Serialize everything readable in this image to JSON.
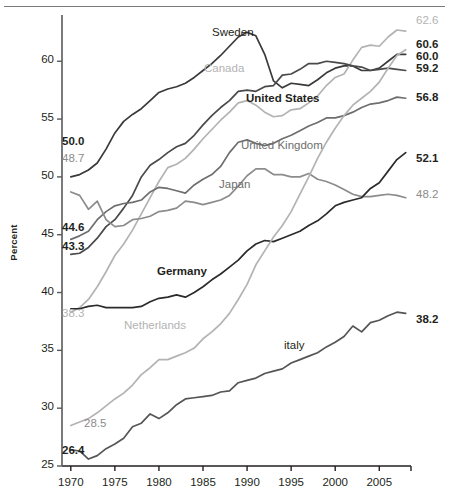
{
  "chart_data": {
    "type": "line",
    "title": "",
    "xlabel": "",
    "ylabel": "Percent",
    "xlim": [
      1969,
      2008.5
    ],
    "ylim": [
      25,
      64
    ],
    "grid": false,
    "legend_position": "inline-labels",
    "xticks": [
      "1970",
      "1975",
      "1980",
      "1985",
      "1990",
      "1995",
      "2000",
      "2005"
    ],
    "xtick_values": [
      1970,
      1975,
      1980,
      1985,
      1990,
      1995,
      2000,
      2005
    ],
    "yticks": [
      "25",
      "30",
      "35",
      "40",
      "45",
      "50",
      "55",
      "60"
    ],
    "ytick_values": [
      25,
      30,
      35,
      40,
      45,
      50,
      55,
      60
    ],
    "series": [
      {
        "name": "Sweden",
        "color": "#3a3a3a",
        "label_x": 212,
        "label_y": 26,
        "start_label": "50.0",
        "end_label": "60.6",
        "x": [
          1970,
          1971,
          1972,
          1973,
          1974,
          1975,
          1976,
          1977,
          1978,
          1979,
          1980,
          1981,
          1982,
          1983,
          1984,
          1985,
          1986,
          1987,
          1988,
          1989,
          1990,
          1991,
          1992,
          1993,
          1994,
          1995,
          1996,
          1997,
          1998,
          1999,
          2000,
          2001,
          2002,
          2003,
          2004,
          2005,
          2006,
          2007,
          2008
        ],
        "values": [
          50.0,
          50.2,
          50.6,
          51.2,
          52.4,
          53.8,
          54.8,
          55.4,
          55.9,
          56.6,
          57.3,
          57.6,
          57.8,
          58.1,
          58.6,
          59.2,
          59.8,
          60.5,
          61.3,
          62.1,
          62.5,
          62.2,
          60.6,
          58.3,
          57.7,
          58.1,
          58.0,
          57.9,
          58.4,
          59.0,
          59.4,
          59.6,
          59.6,
          59.2,
          59.2,
          59.4,
          60.0,
          60.6,
          60.6
        ]
      },
      {
        "name": "Canada",
        "color": "#b3b3b3",
        "label_x": 204,
        "label_y": 62,
        "start_label": "38.3",
        "end_label": "62.6",
        "x": [
          1970,
          1971,
          1972,
          1973,
          1974,
          1975,
          1976,
          1977,
          1978,
          1979,
          1980,
          1981,
          1982,
          1983,
          1984,
          1985,
          1986,
          1987,
          1988,
          1989,
          1990,
          1991,
          1992,
          1993,
          1994,
          1995,
          1996,
          1997,
          1998,
          1999,
          2000,
          2001,
          2002,
          2003,
          2004,
          2005,
          2006,
          2007,
          2008
        ],
        "values": [
          38.3,
          38.7,
          39.4,
          40.5,
          41.8,
          43.2,
          44.2,
          45.4,
          46.8,
          48.2,
          49.6,
          50.8,
          51.1,
          51.6,
          52.4,
          53.3,
          54.1,
          54.9,
          55.6,
          56.4,
          56.6,
          56.2,
          55.6,
          55.2,
          55.3,
          55.8,
          55.9,
          56.4,
          57.0,
          57.9,
          58.6,
          58.9,
          60.1,
          61.2,
          61.4,
          61.3,
          62.1,
          62.7,
          62.6
        ]
      },
      {
        "name": "United States",
        "color": "#4a4a4a",
        "label_x": 246,
        "label_y": 92,
        "start_label": "43.3",
        "end_label": "59.2",
        "x": [
          1970,
          1971,
          1972,
          1973,
          1974,
          1975,
          1976,
          1977,
          1978,
          1979,
          1980,
          1981,
          1982,
          1983,
          1984,
          1985,
          1986,
          1987,
          1988,
          1989,
          1990,
          1991,
          1992,
          1993,
          1994,
          1995,
          1996,
          1997,
          1998,
          1999,
          2000,
          2001,
          2002,
          2003,
          2004,
          2005,
          2006,
          2007,
          2008
        ],
        "values": [
          43.3,
          43.4,
          43.9,
          44.7,
          45.7,
          46.3,
          47.3,
          48.4,
          50.0,
          51.0,
          51.5,
          52.1,
          52.6,
          52.9,
          53.6,
          54.5,
          55.3,
          56.0,
          56.6,
          57.4,
          57.5,
          57.4,
          57.8,
          57.9,
          58.8,
          58.9,
          59.3,
          59.8,
          59.8,
          60.0,
          59.9,
          59.8,
          59.6,
          59.5,
          59.2,
          59.3,
          59.4,
          59.3,
          59.2
        ]
      },
      {
        "name": "United Kingdom",
        "color": "#6e6e6e",
        "label_x": 241,
        "label_y": 139,
        "start_label": "44.6",
        "end_label": "56.8",
        "x": [
          1970,
          1971,
          1972,
          1973,
          1974,
          1975,
          1976,
          1977,
          1978,
          1979,
          1980,
          1981,
          1982,
          1983,
          1984,
          1985,
          1986,
          1987,
          1988,
          1989,
          1990,
          1991,
          1992,
          1993,
          1994,
          1995,
          1996,
          1997,
          1998,
          1999,
          2000,
          2001,
          2002,
          2003,
          2004,
          2005,
          2006,
          2007,
          2008
        ],
        "values": [
          44.6,
          44.9,
          45.3,
          46.3,
          47.0,
          47.5,
          47.7,
          47.8,
          48.0,
          48.7,
          49.1,
          49.0,
          48.8,
          48.6,
          49.3,
          49.8,
          50.2,
          50.9,
          52.1,
          53.0,
          53.2,
          52.9,
          52.7,
          52.9,
          53.3,
          53.6,
          54.0,
          54.4,
          54.7,
          55.1,
          55.1,
          55.3,
          55.6,
          56.0,
          56.3,
          56.4,
          56.6,
          56.9,
          56.8
        ]
      },
      {
        "name": "Japan",
        "color": "#8c8c8c",
        "label_x": 219,
        "label_y": 178,
        "start_label": "48.7",
        "end_label": "48.2",
        "x": [
          1970,
          1971,
          1972,
          1973,
          1974,
          1975,
          1976,
          1977,
          1978,
          1979,
          1980,
          1981,
          1982,
          1983,
          1984,
          1985,
          1986,
          1987,
          1988,
          1989,
          1990,
          1991,
          1992,
          1993,
          1994,
          1995,
          1996,
          1997,
          1998,
          1999,
          2000,
          2001,
          2002,
          2003,
          2004,
          2005,
          2006,
          2007,
          2008
        ],
        "values": [
          48.7,
          48.4,
          47.2,
          47.9,
          46.3,
          45.7,
          45.8,
          46.3,
          46.4,
          46.6,
          47.0,
          47.1,
          47.3,
          47.9,
          47.8,
          47.6,
          47.8,
          48.0,
          48.4,
          49.2,
          50.1,
          50.7,
          50.7,
          50.2,
          50.2,
          50.0,
          50.0,
          50.3,
          49.8,
          49.6,
          49.3,
          48.9,
          48.5,
          48.3,
          48.3,
          48.4,
          48.5,
          48.4,
          48.2
        ]
      },
      {
        "name": "Germany",
        "color": "#2b2b2b",
        "label_x": 157,
        "label_y": 265,
        "start_label": "",
        "end_label": "52.1",
        "x": [
          1970,
          1971,
          1972,
          1973,
          1974,
          1975,
          1976,
          1977,
          1978,
          1979,
          1980,
          1981,
          1982,
          1983,
          1984,
          1985,
          1986,
          1987,
          1988,
          1989,
          1990,
          1991,
          1992,
          1993,
          1994,
          1995,
          1996,
          1997,
          1998,
          1999,
          2000,
          2001,
          2002,
          2003,
          2004,
          2005,
          2006,
          2007,
          2008
        ],
        "values": [
          38.6,
          38.6,
          38.8,
          38.9,
          38.7,
          38.7,
          38.7,
          38.7,
          38.8,
          39.2,
          39.5,
          39.6,
          39.8,
          39.6,
          40.0,
          40.5,
          41.1,
          41.6,
          42.2,
          42.8,
          43.6,
          44.2,
          44.5,
          44.4,
          44.7,
          45.0,
          45.3,
          45.8,
          46.2,
          46.8,
          47.5,
          47.8,
          48.0,
          48.2,
          49.0,
          49.5,
          50.5,
          51.5,
          52.1
        ]
      },
      {
        "name": "Netherlands",
        "color": "#b3b3b3",
        "label_x": 124,
        "label_y": 319,
        "start_label": "28.5",
        "end_label": "",
        "x": [
          1970,
          1971,
          1972,
          1973,
          1974,
          1975,
          1976,
          1977,
          1978,
          1979,
          1980,
          1981,
          1982,
          1983,
          1984,
          1985,
          1986,
          1987,
          1988,
          1989,
          1990,
          1991,
          1992,
          1993,
          1994,
          1995,
          1996,
          1997,
          1998,
          1999,
          2000,
          2001,
          2002,
          2003,
          2004,
          2005,
          2006,
          2007,
          2008
        ],
        "values": [
          28.5,
          28.8,
          29.1,
          29.6,
          30.2,
          30.8,
          31.3,
          32.0,
          32.9,
          33.5,
          34.2,
          34.2,
          34.5,
          34.8,
          35.2,
          36.0,
          36.6,
          37.3,
          38.2,
          39.4,
          40.7,
          42.4,
          43.6,
          44.8,
          45.8,
          47.0,
          48.5,
          50.0,
          51.6,
          53.0,
          54.2,
          55.3,
          56.2,
          56.8,
          57.4,
          58.2,
          59.4,
          60.5,
          61.0
        ]
      },
      {
        "name": "italy",
        "color": "#555555",
        "label_x": 284,
        "label_y": 339,
        "start_label": "26.4",
        "end_label": "38.2",
        "x": [
          1970,
          1971,
          1972,
          1973,
          1974,
          1975,
          1976,
          1977,
          1978,
          1979,
          1980,
          1981,
          1982,
          1983,
          1984,
          1985,
          1986,
          1987,
          1988,
          1989,
          1990,
          1991,
          1992,
          1993,
          1994,
          1995,
          1996,
          1997,
          1998,
          1999,
          2000,
          2001,
          2002,
          2003,
          2004,
          2005,
          2006,
          2007,
          2008
        ],
        "values": [
          26.4,
          26.3,
          25.6,
          25.9,
          26.5,
          26.9,
          27.4,
          28.4,
          28.7,
          29.5,
          29.1,
          29.6,
          30.3,
          30.8,
          30.9,
          31.0,
          31.1,
          31.4,
          31.5,
          32.2,
          32.4,
          32.6,
          33.0,
          33.2,
          33.4,
          33.9,
          34.2,
          34.5,
          34.8,
          35.3,
          35.7,
          36.2,
          37.1,
          36.6,
          37.4,
          37.6,
          38.0,
          38.3,
          38.2
        ]
      }
    ],
    "left_annotations": [
      {
        "text": "50.0",
        "color": "#231f20",
        "x": 62,
        "y": 135
      },
      {
        "text": "48.7",
        "color": "#8c8c8c",
        "x": 62,
        "y": 152
      },
      {
        "text": "44.6",
        "color": "#231f20",
        "x": 62,
        "y": 221
      },
      {
        "text": "43.3",
        "color": "#231f20",
        "x": 62,
        "y": 240
      },
      {
        "text": "38.3",
        "color": "#b3b3b3",
        "x": 62,
        "y": 307
      },
      {
        "text": "28.5",
        "color": "#8c8c8c",
        "x": 84,
        "y": 417
      },
      {
        "text": "26.4",
        "color": "#231f20",
        "x": 62,
        "y": 444
      }
    ],
    "right_annotations": [
      {
        "text": "62.6",
        "color": "#b3b3b3",
        "x": 416,
        "y": 14
      },
      {
        "text": "60.6",
        "color": "#231f20",
        "x": 416,
        "y": 38
      },
      {
        "text": "60.0",
        "color": "#231f20",
        "x": 416,
        "y": 50
      },
      {
        "text": "59.2",
        "color": "#231f20",
        "x": 416,
        "y": 62
      },
      {
        "text": "56.8",
        "color": "#231f20",
        "x": 416,
        "y": 91
      },
      {
        "text": "52.1",
        "color": "#231f20",
        "x": 416,
        "y": 152
      },
      {
        "text": "48.2",
        "color": "#8c8c8c",
        "x": 416,
        "y": 188
      },
      {
        "text": "38.2",
        "color": "#231f20",
        "x": 416,
        "y": 313
      }
    ]
  }
}
